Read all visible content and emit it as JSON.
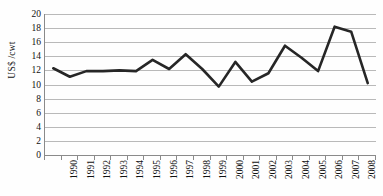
{
  "chart_data": {
    "type": "line",
    "title": "",
    "xlabel": "",
    "ylabel": "US$ /cwt",
    "ylim": [
      0,
      20
    ],
    "ytick_step": 2,
    "yticks": [
      20,
      18,
      16,
      14,
      12,
      10,
      8,
      6,
      4,
      2,
      0
    ],
    "grid": true,
    "legend": false,
    "legend_position": "none",
    "categories": [
      "1990",
      "1991",
      "1992",
      "1993",
      "1994",
      "1995",
      "1996",
      "1997",
      "1998",
      "1999",
      "2000",
      "2001",
      "2002",
      "2003",
      "2004",
      "2005",
      "2006",
      "2007",
      "2008",
      "2009"
    ],
    "series": [
      {
        "name": "US$ /cwt",
        "color": "#262626",
        "line_width": 2.6,
        "values": [
          12.3,
          11.1,
          11.9,
          11.9,
          12.0,
          11.9,
          13.5,
          12.2,
          14.3,
          12.2,
          9.7,
          13.2,
          10.4,
          11.6,
          15.5,
          13.8,
          11.9,
          18.2,
          17.5,
          10.2
        ]
      }
    ]
  },
  "axes": {
    "y_title": "US$ /cwt",
    "axis_color": "#8a8a8a",
    "gridline_color": "#b9b9b9"
  }
}
